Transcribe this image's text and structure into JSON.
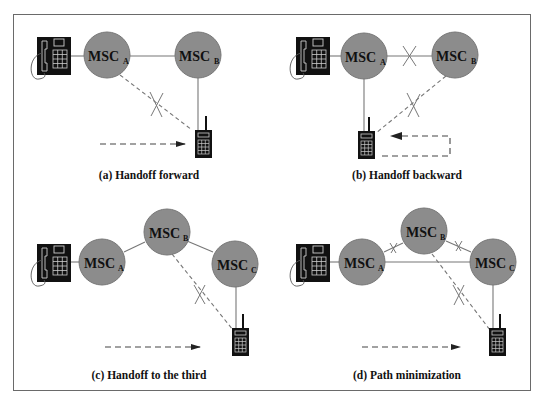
{
  "diagram": {
    "colors": {
      "node_fill": "#8c8c8c",
      "line": "#777777",
      "device": "#111111",
      "border": "#6a6a6a"
    },
    "node_label": "MSC",
    "panels": [
      {
        "id": "a",
        "caption": "(a) Handoff forward",
        "nodes": [
          "A",
          "B"
        ],
        "links": [
          {
            "from": "phone",
            "to": "A",
            "style": "solid"
          },
          {
            "from": "A",
            "to": "B",
            "style": "solid"
          },
          {
            "from": "B",
            "to": "mobile",
            "style": "solid"
          },
          {
            "from": "A",
            "to": "mobile",
            "style": "dashed",
            "broken": true
          }
        ],
        "movement": "rightward toward MSC_B"
      },
      {
        "id": "b",
        "caption": "(b) Handoff backward",
        "nodes": [
          "A",
          "B"
        ],
        "links": [
          {
            "from": "phone",
            "to": "A",
            "style": "solid"
          },
          {
            "from": "A",
            "to": "B",
            "style": "solid",
            "broken": true
          },
          {
            "from": "A",
            "to": "mobile",
            "style": "solid"
          },
          {
            "from": "B",
            "to": "mobile",
            "style": "dashed",
            "broken": true
          }
        ],
        "movement": "returning leftward toward MSC_A"
      },
      {
        "id": "c",
        "caption": "(c) Handoff to the third",
        "nodes": [
          "A",
          "B",
          "C"
        ],
        "links": [
          {
            "from": "phone",
            "to": "A",
            "style": "solid"
          },
          {
            "from": "A",
            "to": "B",
            "style": "solid"
          },
          {
            "from": "B",
            "to": "C",
            "style": "solid"
          },
          {
            "from": "C",
            "to": "mobile",
            "style": "solid"
          },
          {
            "from": "B",
            "to": "mobile",
            "style": "dashed",
            "broken": true
          }
        ],
        "movement": "rightward toward MSC_C"
      },
      {
        "id": "d",
        "caption": "(d) Path minimization",
        "nodes": [
          "A",
          "B",
          "C"
        ],
        "links": [
          {
            "from": "phone",
            "to": "A",
            "style": "solid"
          },
          {
            "from": "A",
            "to": "B",
            "style": "solid",
            "broken": true
          },
          {
            "from": "B",
            "to": "C",
            "style": "solid",
            "broken": true
          },
          {
            "from": "A",
            "to": "C",
            "style": "solid"
          },
          {
            "from": "C",
            "to": "mobile",
            "style": "solid"
          },
          {
            "from": "B",
            "to": "mobile",
            "style": "dashed",
            "broken": true
          }
        ],
        "movement": "rightward toward MSC_C"
      }
    ]
  }
}
